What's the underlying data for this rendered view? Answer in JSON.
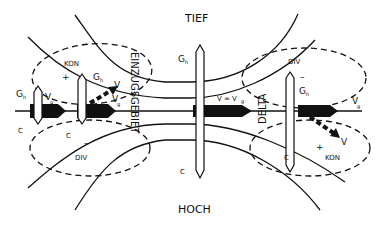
{
  "diagram": {
    "title_low": "TIEF",
    "title_high": "HOCH",
    "region_entrance": "EINZUGSGEBIET",
    "region_delta": "DELTA",
    "center_label": "V = V",
    "center_label_sub": "g",
    "labels": {
      "kon": "KON",
      "div": "DIV",
      "g": "G",
      "g_sub": "h",
      "v": "V",
      "vg": "V",
      "vg_sub": "g",
      "c": "C",
      "plus": "+",
      "minus": "–"
    },
    "colors": {
      "line": "#111111",
      "background": "#ffffff"
    }
  }
}
